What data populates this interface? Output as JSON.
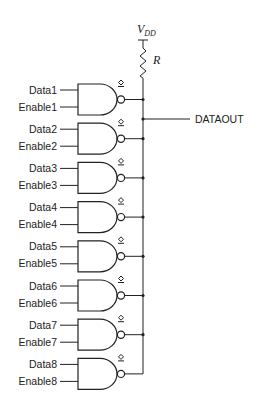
{
  "supply": {
    "label": "V",
    "subscript": "DD"
  },
  "resistor": {
    "label": "R"
  },
  "output": {
    "label": "DATAOUT"
  },
  "gate_type": "NAND (open-drain)",
  "gates": [
    {
      "data": "Data1",
      "enable": "Enable1"
    },
    {
      "data": "Data2",
      "enable": "Enable2"
    },
    {
      "data": "Data3",
      "enable": "Enable3"
    },
    {
      "data": "Data4",
      "enable": "Enable4"
    },
    {
      "data": "Data5",
      "enable": "Enable5"
    },
    {
      "data": "Data6",
      "enable": "Enable6"
    },
    {
      "data": "Data7",
      "enable": "Enable7"
    },
    {
      "data": "Data8",
      "enable": "Enable8"
    }
  ]
}
